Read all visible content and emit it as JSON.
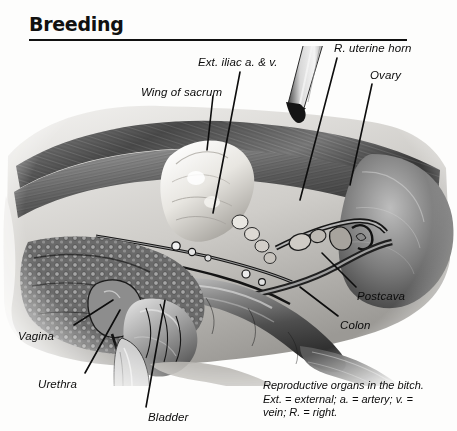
{
  "page": {
    "title": "Breeding",
    "domain": "veterinary-anatomy-illustration",
    "palette": {
      "ink": "#0b0b0b",
      "paper": "#fdfdfc",
      "tissue_dark": "#2b2b2b",
      "tissue_mid": "#6f6f6f",
      "tissue_light": "#c9c9c9",
      "bone_highlight": "#f2f1ee"
    }
  },
  "labels": [
    {
      "id": "ext-iliac",
      "text": "Ext. iliac a. & v.",
      "x": 198,
      "y": 56
    },
    {
      "id": "r-uterine-horn",
      "text": "R. uterine horn",
      "x": 334,
      "y": 42
    },
    {
      "id": "ovary",
      "text": "Ovary",
      "x": 370,
      "y": 69
    },
    {
      "id": "wing-of-sacrum",
      "text": "Wing of sacrum",
      "x": 141,
      "y": 86
    },
    {
      "id": "postcava",
      "text": "Postcava",
      "x": 357,
      "y": 290
    },
    {
      "id": "colon",
      "text": "Colon",
      "x": 340,
      "y": 319
    },
    {
      "id": "vagina",
      "text": "Vagina",
      "x": 18,
      "y": 330
    },
    {
      "id": "urethra",
      "text": "Urethra",
      "x": 38,
      "y": 378
    },
    {
      "id": "bladder",
      "text": "Bladder",
      "x": 148,
      "y": 411
    }
  ],
  "leaders": [
    {
      "id": "leader-ext-iliac",
      "from": [
        240,
        72
      ],
      "to": [
        213,
        213
      ]
    },
    {
      "id": "leader-r-uterine-horn",
      "from": [
        337,
        58
      ],
      "to": [
        300,
        200
      ]
    },
    {
      "id": "leader-ovary",
      "from": [
        372,
        84
      ],
      "to": [
        350,
        185
      ]
    },
    {
      "id": "leader-wing-of-sacrum",
      "from": [
        213,
        96
      ],
      "to": [
        207,
        150
      ]
    },
    {
      "id": "leader-postcava",
      "from": [
        356,
        287
      ],
      "to": [
        322,
        253
      ]
    },
    {
      "id": "leader-colon",
      "from": [
        338,
        316
      ],
      "to": [
        300,
        287
      ]
    },
    {
      "id": "leader-vagina",
      "from": [
        74,
        325
      ],
      "to": [
        113,
        300
      ]
    },
    {
      "id": "leader-urethra",
      "from": [
        85,
        373
      ],
      "to": [
        120,
        310
      ]
    },
    {
      "id": "leader-bladder",
      "from": [
        146,
        407
      ],
      "to": [
        165,
        300
      ]
    }
  ],
  "caption": {
    "line1": "Reproductive organs in the bitch.",
    "line2": "Ext. = external; a. = artery; v. =",
    "line3": "vein; R. = right."
  },
  "figure": {
    "alt": "Grayscale surgical illustration of the caudal abdomen of a bitch, dissected to expose the reproductive tract, with a retractor probe entering from upper right.",
    "instrument": "retractor-probe"
  }
}
